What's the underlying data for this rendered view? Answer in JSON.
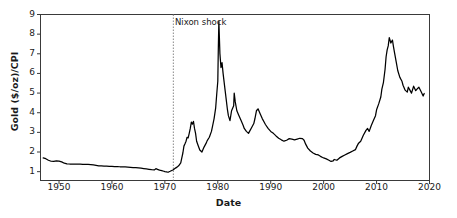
{
  "chart_data": {
    "type": "line",
    "title": "",
    "xlabel": "Date",
    "ylabel": "Gold ($/oz)/CPI",
    "xlim": [
      1946.5,
      2020.0
    ],
    "ylim": [
      0.55,
      9.0
    ],
    "xticks": [
      1950,
      1960,
      1970,
      1980,
      1990,
      2000,
      2010,
      2020
    ],
    "yticks": [
      1,
      2,
      3,
      4,
      5,
      6,
      7,
      8,
      9
    ],
    "grid": false,
    "legend": null,
    "line_color": "#000000",
    "annotations": [
      {
        "label": "Nixon shock",
        "x": 1971.6,
        "marker": "dotted-vertical-line",
        "line_color": "#888888",
        "text_x": 1971.9,
        "text_y": 8.55
      }
    ],
    "series": [
      {
        "name": "Gold ($/oz)/CPI",
        "x": [
          1947.0,
          1947.5,
          1948.0,
          1948.5,
          1949.0,
          1949.5,
          1950.0,
          1950.5,
          1951.0,
          1951.5,
          1952.0,
          1952.5,
          1953.0,
          1953.5,
          1954.0,
          1954.5,
          1955.0,
          1955.5,
          1956.0,
          1956.5,
          1957.0,
          1957.5,
          1958.0,
          1958.5,
          1959.0,
          1959.5,
          1960.0,
          1960.5,
          1961.0,
          1961.5,
          1962.0,
          1962.5,
          1963.0,
          1963.5,
          1964.0,
          1964.5,
          1965.0,
          1965.5,
          1966.0,
          1966.5,
          1967.0,
          1967.5,
          1968.0,
          1968.3,
          1968.6,
          1969.0,
          1969.4,
          1969.8,
          1970.0,
          1970.3,
          1970.6,
          1971.0,
          1971.3,
          1971.6,
          1972.0,
          1972.3,
          1972.6,
          1973.0,
          1973.2,
          1973.4,
          1973.6,
          1973.8,
          1974.0,
          1974.2,
          1974.4,
          1974.6,
          1974.8,
          1975.0,
          1975.2,
          1975.4,
          1975.6,
          1975.8,
          1976.0,
          1976.3,
          1976.6,
          1977.0,
          1977.4,
          1977.8,
          1978.0,
          1978.4,
          1978.8,
          1979.0,
          1979.3,
          1979.6,
          1979.8,
          1980.0,
          1980.1,
          1980.2,
          1980.4,
          1980.6,
          1980.8,
          1981.0,
          1981.4,
          1981.8,
          1982.0,
          1982.3,
          1982.6,
          1983.0,
          1983.1,
          1983.3,
          1983.6,
          1984.0,
          1984.4,
          1984.8,
          1985.0,
          1985.4,
          1985.8,
          1986.0,
          1986.4,
          1986.8,
          1987.0,
          1987.3,
          1987.6,
          1988.0,
          1988.4,
          1988.8,
          1989.0,
          1989.5,
          1990.0,
          1990.5,
          1991.0,
          1991.5,
          1992.0,
          1992.5,
          1993.0,
          1993.5,
          1994.0,
          1994.5,
          1995.0,
          1995.5,
          1996.0,
          1996.3,
          1996.6,
          1997.0,
          1997.5,
          1998.0,
          1998.5,
          1999.0,
          1999.4,
          1999.8,
          2000.0,
          2000.5,
          2001.0,
          2001.4,
          2001.8,
          2002.0,
          2002.5,
          2003.0,
          2003.5,
          2004.0,
          2004.5,
          2005.0,
          2005.5,
          2006.0,
          2006.3,
          2006.6,
          2007.0,
          2007.5,
          2008.0,
          2008.3,
          2008.6,
          2009.0,
          2009.4,
          2009.8,
          2010.0,
          2010.4,
          2010.8,
          2011.0,
          2011.3,
          2011.6,
          2011.8,
          2012.0,
          2012.2,
          2012.4,
          2012.7,
          2013.0,
          2013.2,
          2013.4,
          2013.7,
          2014.0,
          2014.4,
          2014.8,
          2015.0,
          2015.4,
          2015.8,
          2016.0,
          2016.3,
          2016.6,
          2017.0,
          2017.4,
          2017.8,
          2018.0,
          2018.4,
          2018.8,
          2019.0
        ],
        "y": [
          1.7,
          1.66,
          1.58,
          1.53,
          1.52,
          1.55,
          1.54,
          1.5,
          1.43,
          1.4,
          1.39,
          1.39,
          1.39,
          1.38,
          1.38,
          1.37,
          1.37,
          1.37,
          1.36,
          1.34,
          1.32,
          1.3,
          1.29,
          1.28,
          1.28,
          1.27,
          1.27,
          1.26,
          1.26,
          1.25,
          1.25,
          1.24,
          1.23,
          1.22,
          1.21,
          1.2,
          1.19,
          1.18,
          1.16,
          1.14,
          1.12,
          1.1,
          1.09,
          1.15,
          1.12,
          1.08,
          1.05,
          1.02,
          1.0,
          0.99,
          0.97,
          1.02,
          1.06,
          1.1,
          1.18,
          1.23,
          1.3,
          1.45,
          1.7,
          1.95,
          2.3,
          2.42,
          2.55,
          2.75,
          2.72,
          2.95,
          3.2,
          3.52,
          3.42,
          3.56,
          3.2,
          2.95,
          2.55,
          2.32,
          2.1,
          2.0,
          2.25,
          2.45,
          2.58,
          2.75,
          3.05,
          3.3,
          3.7,
          4.25,
          4.95,
          5.6,
          7.3,
          8.65,
          7.0,
          6.3,
          6.55,
          6.0,
          5.1,
          4.2,
          3.85,
          3.6,
          4.1,
          4.35,
          5.0,
          4.55,
          4.1,
          3.85,
          3.6,
          3.35,
          3.2,
          3.05,
          2.95,
          3.05,
          3.25,
          3.45,
          3.68,
          4.1,
          4.2,
          3.95,
          3.7,
          3.5,
          3.4,
          3.2,
          3.05,
          2.95,
          2.82,
          2.7,
          2.62,
          2.55,
          2.6,
          2.68,
          2.66,
          2.62,
          2.66,
          2.7,
          2.68,
          2.6,
          2.4,
          2.2,
          2.05,
          1.95,
          1.88,
          1.85,
          1.78,
          1.72,
          1.7,
          1.65,
          1.58,
          1.52,
          1.55,
          1.62,
          1.58,
          1.7,
          1.78,
          1.85,
          1.92,
          1.98,
          2.05,
          2.12,
          2.3,
          2.45,
          2.55,
          2.85,
          3.1,
          3.2,
          3.05,
          3.35,
          3.6,
          3.85,
          4.15,
          4.45,
          4.8,
          5.2,
          5.55,
          6.2,
          6.85,
          7.2,
          7.4,
          7.82,
          7.55,
          7.7,
          7.35,
          7.05,
          6.6,
          6.15,
          5.8,
          5.6,
          5.4,
          5.15,
          5.05,
          5.3,
          5.15,
          5.0,
          5.35,
          5.12,
          5.25,
          5.3,
          5.08,
          4.85,
          4.98
        ]
      }
    ]
  },
  "axis_labels": {
    "x": "Date",
    "y": "Gold ($/oz)/CPI"
  }
}
